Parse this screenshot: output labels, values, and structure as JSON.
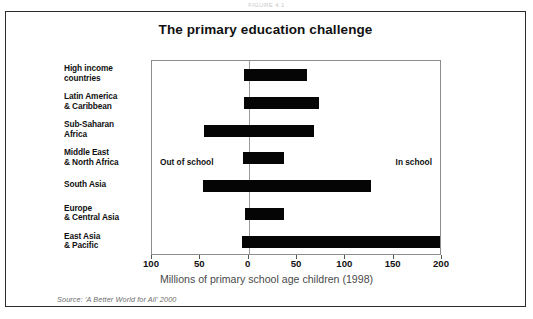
{
  "page": {
    "top_stub_text": "FIGURE 4.1"
  },
  "figure": {
    "title": "The primary education challenge",
    "source_note": "Source: 'A Better World for All' 2000",
    "annotation_left": "Out of school",
    "annotation_right": "In school"
  },
  "chart_data": {
    "type": "bar",
    "orientation": "horizontal",
    "title": "The primary education challenge",
    "subtitle": "",
    "xlabel": "Millions of primary school age children (1998)",
    "ylabel": "",
    "xlim": [
      -100,
      200
    ],
    "xticks": [
      -100,
      -50,
      0,
      50,
      100,
      150,
      200
    ],
    "xticklabels": [
      "100",
      "50",
      "0",
      "50",
      "100",
      "150",
      "200"
    ],
    "grid": false,
    "legend": "none",
    "zero_line": 0,
    "annotations": [
      {
        "text": "Out of school",
        "side": "left"
      },
      {
        "text": "In school",
        "side": "right"
      }
    ],
    "categories": [
      "High income countries",
      "Latin America & Caribbean",
      "Sub-Saharan Africa",
      "Middle East & North Africa",
      "South Asia",
      "Europe & Central Asia",
      "East Asia & Pacific"
    ],
    "category_lines": [
      [
        "High income",
        "countries"
      ],
      [
        "Latin America",
        "& Caribbean"
      ],
      [
        "Sub-Saharan",
        "Africa"
      ],
      [
        "Middle East",
        "& North Africa"
      ],
      [
        "South Asia",
        ""
      ],
      [
        "Europe",
        "& Central Asia"
      ],
      [
        "East Asia",
        "& Pacific"
      ]
    ],
    "series": [
      {
        "name": "Out of school",
        "values": [
          5,
          5,
          46,
          6,
          47,
          4,
          7
        ]
      },
      {
        "name": "In school",
        "values": [
          60,
          73,
          68,
          37,
          127,
          37,
          198
        ]
      }
    ],
    "bar_extents": [
      {
        "category": "High income countries",
        "start": -5,
        "end": 60
      },
      {
        "category": "Latin America & Caribbean",
        "start": -5,
        "end": 73
      },
      {
        "category": "Sub-Saharan Africa",
        "start": -46,
        "end": 68
      },
      {
        "category": "Middle East & North Africa",
        "start": -6,
        "end": 37
      },
      {
        "category": "South Asia",
        "start": -47,
        "end": 127
      },
      {
        "category": "Europe & Central Asia",
        "start": -4,
        "end": 37
      },
      {
        "category": "East Asia & Pacific",
        "start": -7,
        "end": 198
      }
    ],
    "bar_color": "#050505"
  }
}
